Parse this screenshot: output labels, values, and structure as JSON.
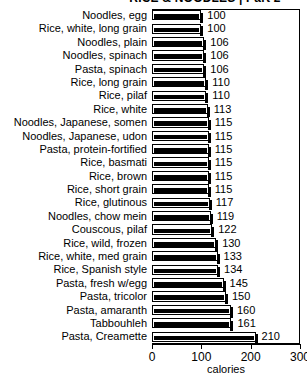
{
  "chart_data": {
    "type": "bar",
    "orientation": "horizontal",
    "title": "RICE & NOODLES | Part 2",
    "xlabel": "calories",
    "ylabel": "",
    "xlim": [
      0,
      300
    ],
    "xticks": [
      0,
      100,
      200,
      300
    ],
    "grid": false,
    "legend": false,
    "categories": [
      "Noodles, egg",
      "Rice, white, long grain",
      "Noodles, plain",
      "Noodles, spinach",
      "Pasta, spinach",
      "Rice, long grain",
      "Rice, pilaf",
      "Rice, white",
      "Noodles, Japanese, somen",
      "Noodles, Japanese, udon",
      "Pasta, protein-fortified",
      "Rice, basmati",
      "Rice, brown",
      "Rice, short grain",
      "Rice, glutinous",
      "Noodles, chow mein",
      "Couscous, pilaf",
      "Rice, wild, frozen",
      "Rice, white, med grain",
      "Rice, Spanish style",
      "Pasta, fresh w/egg",
      "Pasta, tricolor",
      "Pasta, amaranth",
      "Tabbouhleh",
      "Pasta, Creamette"
    ],
    "values": [
      100,
      100,
      106,
      106,
      106,
      110,
      110,
      113,
      115,
      115,
      115,
      115,
      115,
      115,
      117,
      119,
      122,
      130,
      133,
      134,
      145,
      150,
      160,
      161,
      210
    ],
    "value_labels": [
      "100",
      "100",
      "106",
      "106",
      "106",
      "110",
      "110",
      "113",
      "115",
      "115",
      "115",
      "115",
      "115",
      "115",
      "117",
      "119",
      "122",
      "130",
      "133",
      "134",
      "145",
      "150",
      "160",
      "161",
      "210"
    ]
  },
  "colors": {
    "bar_fill": "#ffffff",
    "bar_outline": "#000000",
    "bar_band": "#000000",
    "axis": "#000000",
    "text": "#000000",
    "background": "#ffffff"
  }
}
